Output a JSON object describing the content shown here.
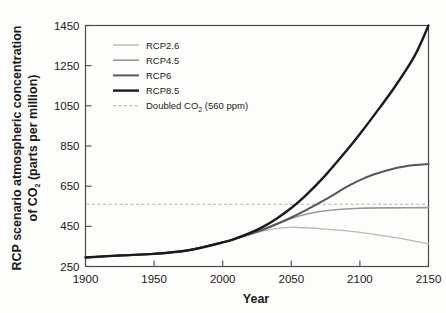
{
  "chart_data": {
    "type": "line",
    "title": "",
    "xlabel": "Year",
    "ylabel_line1": "RCP scenario atmospheric concentration",
    "ylabel_line2_pre": "of CO",
    "ylabel_line2_sub": "2",
    "ylabel_line2_post": " (parts per million)",
    "xlim": [
      1900,
      2150
    ],
    "ylim": [
      250,
      1450
    ],
    "xticks": [
      1900,
      1950,
      2000,
      2050,
      2100,
      2150
    ],
    "yticks": [
      250,
      450,
      650,
      850,
      1050,
      1250,
      1450
    ],
    "grid": false,
    "legend_position": "upper-left-inside",
    "annotations": [
      {
        "name": "doubled-co2-threshold",
        "value": 560,
        "label": "Doubled CO2 (560 ppm)"
      }
    ],
    "series": [
      {
        "name": "RCP2.6",
        "color": "#b9b9b9",
        "width": 1.4,
        "dash": "none",
        "x": [
          1900,
          1925,
          1950,
          1975,
          2000,
          2010,
          2020,
          2030,
          2040,
          2050,
          2060,
          2075,
          2100,
          2125,
          2150
        ],
        "values": [
          295,
          305,
          313,
          331,
          370,
          389,
          410,
          428,
          440,
          445,
          443,
          436,
          420,
          395,
          363
        ]
      },
      {
        "name": "RCP4.5",
        "color": "#9a9a9a",
        "width": 1.6,
        "dash": "none",
        "x": [
          1900,
          1925,
          1950,
          1975,
          2000,
          2010,
          2020,
          2030,
          2040,
          2050,
          2060,
          2075,
          2100,
          2125,
          2150
        ],
        "values": [
          295,
          305,
          313,
          331,
          370,
          389,
          412,
          437,
          465,
          489,
          509,
          528,
          540,
          542,
          543
        ]
      },
      {
        "name": "RCP6",
        "color": "#585858",
        "width": 2.0,
        "dash": "none",
        "x": [
          1900,
          1925,
          1950,
          1975,
          2000,
          2010,
          2020,
          2030,
          2040,
          2050,
          2060,
          2075,
          2090,
          2100,
          2110,
          2125,
          2140,
          2150
        ],
        "values": [
          295,
          305,
          313,
          331,
          370,
          389,
          411,
          435,
          463,
          494,
          528,
          584,
          645,
          680,
          708,
          738,
          755,
          760
        ]
      },
      {
        "name": "RCP8.5",
        "color": "#1a1a1a",
        "width": 2.4,
        "dash": "none",
        "x": [
          1900,
          1925,
          1950,
          1975,
          2000,
          2010,
          2020,
          2030,
          2040,
          2050,
          2060,
          2075,
          2090,
          2100,
          2110,
          2125,
          2140,
          2150
        ],
        "values": [
          295,
          305,
          313,
          331,
          370,
          391,
          417,
          450,
          492,
          541,
          600,
          705,
          825,
          910,
          1000,
          1140,
          1300,
          1450
        ]
      }
    ],
    "legend_entries": [
      {
        "label": "RCP2.6",
        "color": "#b9b9b9",
        "width": 1.4,
        "dash": "none"
      },
      {
        "label": "RCP4.5",
        "color": "#9a9a9a",
        "width": 1.6,
        "dash": "none"
      },
      {
        "label": "RCP6",
        "color": "#585858",
        "width": 2.0,
        "dash": "none"
      },
      {
        "label": "RCP8.5",
        "color": "#1a1a1a",
        "width": 2.4,
        "dash": "none"
      },
      {
        "label": "Doubled CO2 (560 ppm)",
        "color": "#b0b0b0",
        "width": 1.1,
        "dash": "3,2.5"
      }
    ]
  },
  "axis": {
    "x_title": "Year",
    "x_ticks": [
      "1900",
      "1950",
      "2000",
      "2050",
      "2100",
      "2150"
    ],
    "y_ticks": [
      "1450",
      "1250",
      "1050",
      "850",
      "650",
      "450",
      "250"
    ]
  },
  "legend": {
    "rcp26": "RCP2.6",
    "rcp45": "RCP4.5",
    "rcp6": "RCP6",
    "rcp85": "RCP8.5",
    "doubled_pre": "Doubled CO",
    "doubled_sub": "2",
    "doubled_post": " (560 ppm)"
  },
  "ylabel": {
    "line1": "RCP scenario atmospheric concentration",
    "line2_pre": "of CO",
    "line2_sub": "2",
    "line2_post": " (parts per million)"
  }
}
